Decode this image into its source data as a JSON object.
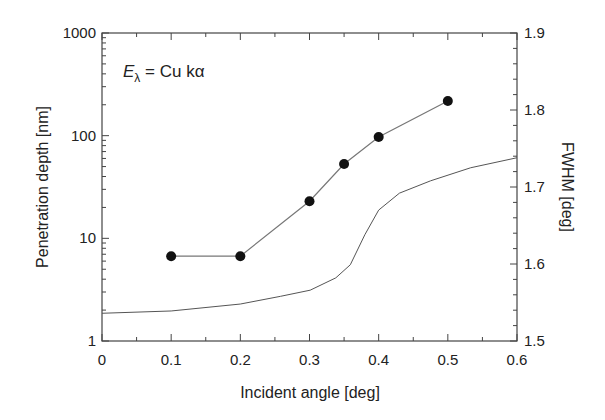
{
  "chart_data": {
    "type": "line",
    "title": "",
    "annotation": {
      "symbol": "E",
      "subscript": "λ",
      "text": " = Cu kα"
    },
    "xlabel": "Incident angle [deg]",
    "ylabel": "Penetration depth [nm]",
    "y2label": "FWHM [deg]",
    "xlim": [
      0,
      0.6
    ],
    "ylim": [
      1,
      1000
    ],
    "yscale": "log",
    "y2lim": [
      1.5,
      1.9
    ],
    "x_ticks": [
      "0",
      "0.1",
      "0.2",
      "0.3",
      "0.4",
      "0.5",
      "0.6"
    ],
    "y_ticks": [
      "1",
      "10",
      "100",
      "1000"
    ],
    "y2_ticks": [
      "1.5",
      "1.6",
      "1.7",
      "1.8",
      "1.9"
    ],
    "grid": false,
    "series": [
      {
        "name": "Penetration depth",
        "axis": "left",
        "marker": "circle",
        "x": [
          0.1,
          0.2,
          0.3,
          0.35,
          0.4,
          0.5
        ],
        "values": [
          6.7,
          6.7,
          23,
          53,
          97,
          218
        ]
      },
      {
        "name": "FWHM",
        "axis": "right",
        "marker": "none",
        "x": [
          0.0,
          0.1,
          0.2,
          0.258,
          0.301,
          0.338,
          0.359,
          0.38,
          0.4,
          0.43,
          0.475,
          0.533,
          0.6
        ],
        "values": [
          1.536,
          1.539,
          1.548,
          1.558,
          1.566,
          1.582,
          1.599,
          1.638,
          1.67,
          1.692,
          1.708,
          1.725,
          1.738
        ]
      }
    ]
  }
}
